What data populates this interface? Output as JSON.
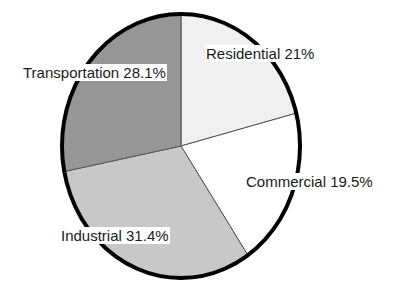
{
  "chart_data": {
    "type": "pie",
    "title": "",
    "xlabel": "",
    "ylabel": "",
    "legend_position": "none",
    "grid": false,
    "start_angle_deg": 0,
    "direction": "clockwise",
    "categories": [
      "Residential",
      "Commercial",
      "Industrial",
      "Transportation"
    ],
    "values": [
      21,
      19.5,
      31.4,
      28.1
    ],
    "value_unit": "%",
    "slices": [
      {
        "label": "Residential",
        "value": 21,
        "value_text": "21%",
        "label_text": "Residential 21%",
        "color": "#f0f0f0",
        "start_deg": 0,
        "end_deg": 75.6
      },
      {
        "label": "Commercial",
        "value": 19.5,
        "value_text": "19.5%",
        "label_text": "Commercial  19.5%",
        "color": "#ffffff",
        "start_deg": 75.6,
        "end_deg": 145.8
      },
      {
        "label": "Industrial",
        "value": 31.4,
        "value_text": "31.4%",
        "label_text": "Industrial 31.4%",
        "color": "#c8c8c8",
        "start_deg": 145.8,
        "end_deg": 258.84
      },
      {
        "label": "Transportation",
        "value": 28.1,
        "value_text": "28.1%",
        "label_text": "Transportation 28.1%",
        "color": "#969696",
        "start_deg": 258.84,
        "end_deg": 360
      }
    ],
    "styling": {
      "outline_color": "#000000",
      "divider_color": "#555555",
      "label_text_color": "#1a1a1a",
      "label_background": "#ffffff",
      "background": "#ffffff"
    }
  }
}
